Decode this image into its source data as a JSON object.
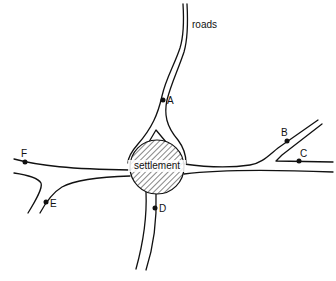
{
  "diagram": {
    "title_label": "roads",
    "settlement_label": "settlement",
    "colors": {
      "ink": "#111111",
      "background": "#ffffff"
    },
    "points": [
      {
        "id": "A",
        "label": "A",
        "x": 163,
        "y": 100
      },
      {
        "id": "B",
        "label": "B",
        "x": 287,
        "y": 141
      },
      {
        "id": "C",
        "label": "C",
        "x": 299,
        "y": 161
      },
      {
        "id": "D",
        "label": "D",
        "x": 155,
        "y": 208
      },
      {
        "id": "E",
        "label": "E",
        "x": 46,
        "y": 202
      },
      {
        "id": "F",
        "label": "F",
        "x": 25,
        "y": 162
      }
    ]
  }
}
